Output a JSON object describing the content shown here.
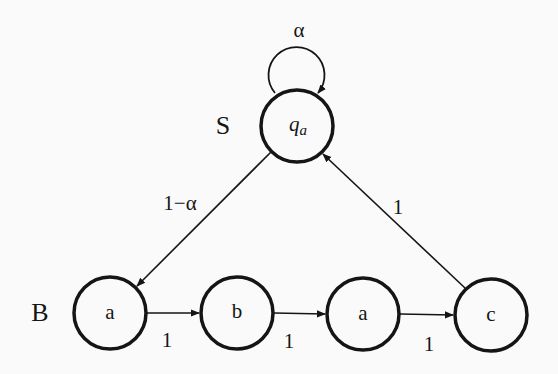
{
  "diagram": {
    "type": "state-transition-graph",
    "background": "#fafafa",
    "stroke_color": "#151515",
    "group_labels": {
      "top": "S",
      "bottom": "B"
    },
    "nodes": [
      {
        "id": "qa",
        "label_main": "q",
        "label_sub": "a",
        "x": 297,
        "y": 126
      },
      {
        "id": "a1",
        "label": "a",
        "x": 110,
        "y": 313
      },
      {
        "id": "b",
        "label": "b",
        "x": 237,
        "y": 313
      },
      {
        "id": "a2",
        "label": "a",
        "x": 363,
        "y": 314
      },
      {
        "id": "c",
        "label": "c",
        "x": 491,
        "y": 315
      }
    ],
    "edges": [
      {
        "from": "qa",
        "to": "qa",
        "label": "α"
      },
      {
        "from": "qa",
        "to": "a1",
        "label": "1−α"
      },
      {
        "from": "a1",
        "to": "b",
        "label": "1"
      },
      {
        "from": "b",
        "to": "a2",
        "label": "1"
      },
      {
        "from": "a2",
        "to": "c",
        "label": "1"
      },
      {
        "from": "c",
        "to": "qa",
        "label": "1"
      }
    ]
  }
}
